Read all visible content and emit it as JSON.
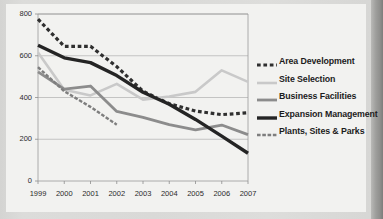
{
  "chart_data": {
    "type": "line",
    "title": "",
    "subtitle": "",
    "xlabel": "",
    "ylabel": "",
    "x": [
      1999,
      2000,
      2001,
      2002,
      2003,
      2004,
      2005,
      2006,
      2007
    ],
    "xtick_labels": [
      "1999",
      "2000",
      "2001",
      "2002",
      "2003",
      "2004",
      "2005",
      "2006",
      "2007"
    ],
    "ytick_labels": [
      "0",
      "200",
      "400",
      "600",
      "800"
    ],
    "yticks": [
      0,
      200,
      400,
      600,
      800
    ],
    "ylim": [
      0,
      800
    ],
    "xlim": [
      1999,
      2007
    ],
    "grid": "horizontal",
    "legend_position": "right",
    "series": [
      {
        "name": "Area Development",
        "style": "dashed",
        "color": "#2f2f2f",
        "width": 3.2,
        "values": [
          775,
          645,
          645,
          548,
          430,
          370,
          335,
          318,
          327
        ]
      },
      {
        "name": "Site Selection",
        "style": "solid",
        "color": "#c9c9c9",
        "width": 2.6,
        "values": [
          615,
          437,
          410,
          465,
          390,
          405,
          427,
          530,
          475
        ]
      },
      {
        "name": "Business Facilities",
        "style": "solid",
        "color": "#8c8c8c",
        "width": 2.8,
        "values": [
          523,
          440,
          455,
          333,
          305,
          270,
          245,
          268,
          222
        ]
      },
      {
        "name": "Expansion Management",
        "style": "solid",
        "color": "#242424",
        "width": 3.4,
        "values": [
          650,
          590,
          567,
          505,
          425,
          368,
          295,
          215,
          133
        ]
      },
      {
        "name": "Plants, Sites & Parks",
        "style": "fine-dashed",
        "color": "#7e7e7e",
        "width": 2.4,
        "values": [
          545,
          430,
          355,
          270,
          null,
          null,
          null,
          null,
          null
        ]
      }
    ]
  },
  "legend": {
    "items": [
      {
        "label": "Area Development"
      },
      {
        "label": "Site Selection"
      },
      {
        "label": "Business Facilities"
      },
      {
        "label": "Expansion Management"
      },
      {
        "label": "Plants, Sites & Parks"
      }
    ]
  }
}
